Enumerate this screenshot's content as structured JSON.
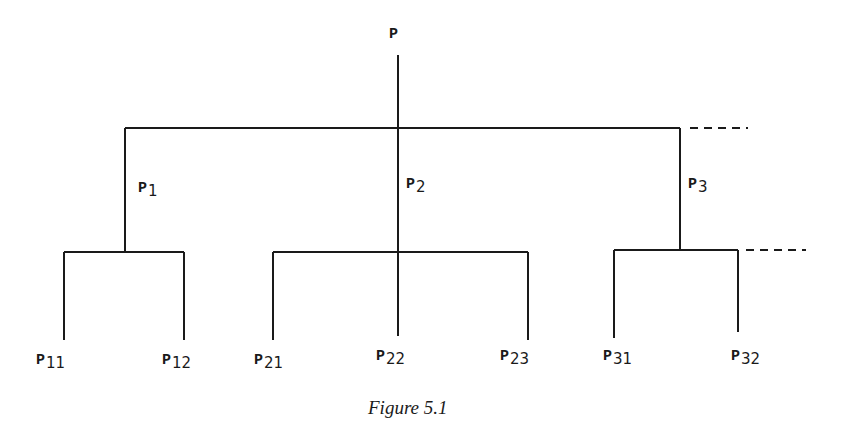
{
  "diagram": {
    "type": "tree",
    "root": {
      "label": "P",
      "subscript": ""
    },
    "level1": [
      {
        "label": "P",
        "subscript": "1"
      },
      {
        "label": "P",
        "subscript": "2"
      },
      {
        "label": "P",
        "subscript": "3"
      }
    ],
    "level2": [
      {
        "label": "P",
        "subscript": "11"
      },
      {
        "label": "P",
        "subscript": "12"
      },
      {
        "label": "P",
        "subscript": "21"
      },
      {
        "label": "P",
        "subscript": "22"
      },
      {
        "label": "P",
        "subscript": "23"
      },
      {
        "label": "P",
        "subscript": "31"
      },
      {
        "label": "P",
        "subscript": "32"
      }
    ],
    "line_color": "#1a1a1a",
    "continuation": "dashed lines indicate further branches"
  },
  "caption": "Figure 5.1"
}
